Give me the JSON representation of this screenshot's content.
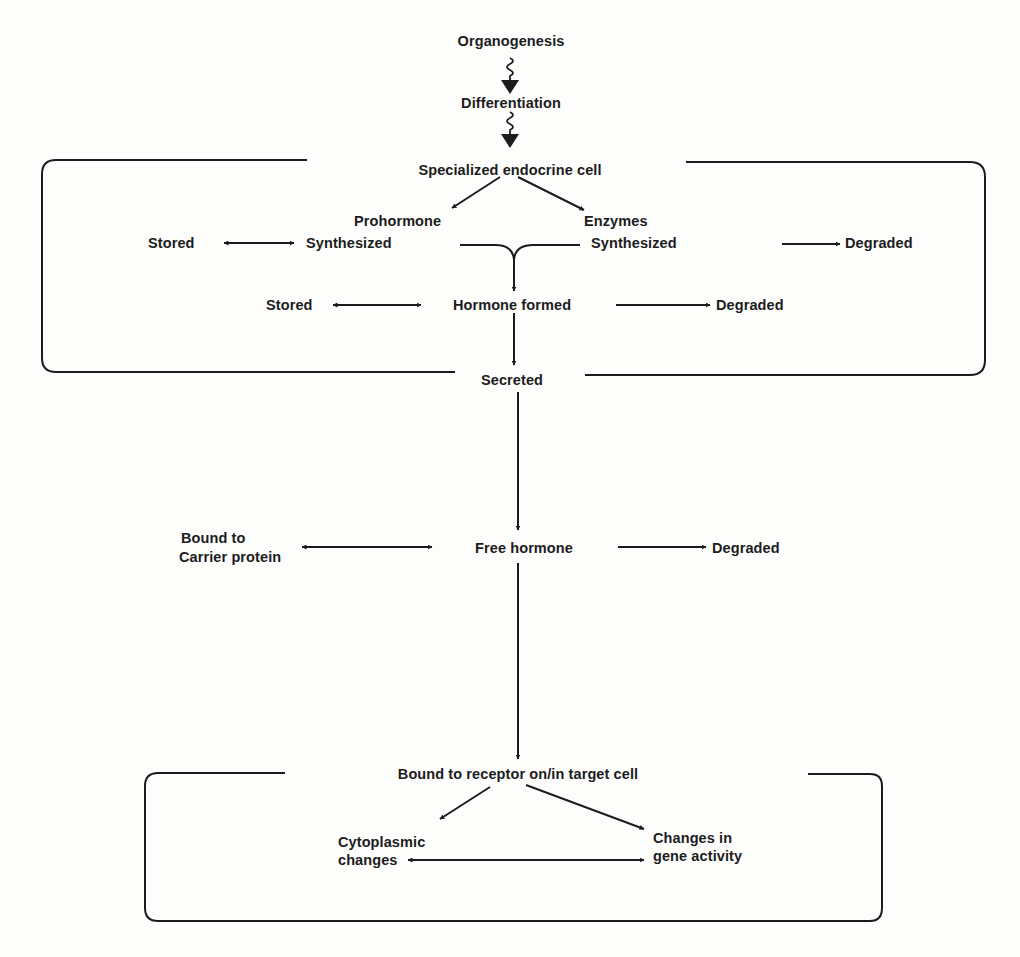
{
  "diagram": {
    "type": "flowchart",
    "nodes": {
      "organogenesis": "Organogenesis",
      "differentiation": "Differentiation",
      "specialized_cell": "Specialized endocrine cell",
      "prohormone": "Prohormone",
      "prohormone_synthesized": "Synthesized",
      "prohormone_stored": "Stored",
      "enzymes": "Enzymes",
      "enzymes_synthesized": "Synthesized",
      "enzymes_degraded": "Degraded",
      "hormone_formed": "Hormone formed",
      "hormone_stored": "Stored",
      "hormone_degraded": "Degraded",
      "secreted": "Secreted",
      "bound_carrier_line1": "Bound to",
      "bound_carrier_line2": "Carrier protein",
      "free_hormone": "Free hormone",
      "free_degraded": "Degraded",
      "bound_receptor": "Bound to receptor on/in target cell",
      "cytoplasmic_line1": "Cytoplasmic",
      "cytoplasmic_line2": "changes",
      "gene_line1": "Changes in",
      "gene_line2": "gene activity"
    },
    "edges": [
      {
        "from": "Organogenesis",
        "to": "Differentiation",
        "style": "wavy"
      },
      {
        "from": "Differentiation",
        "to": "Specialized endocrine cell",
        "style": "wavy"
      },
      {
        "from": "Specialized endocrine cell",
        "to": "Prohormone Synthesized",
        "style": "arrow"
      },
      {
        "from": "Specialized endocrine cell",
        "to": "Enzymes Synthesized",
        "style": "arrow"
      },
      {
        "from": "Prohormone Synthesized",
        "to": "Stored",
        "style": "bidirectional"
      },
      {
        "from": "Enzymes Synthesized",
        "to": "Degraded",
        "style": "arrow"
      },
      {
        "from": "Prohormone Synthesized + Enzymes Synthesized",
        "to": "Hormone formed",
        "style": "merge-arrow"
      },
      {
        "from": "Hormone formed",
        "to": "Stored",
        "style": "bidirectional"
      },
      {
        "from": "Hormone formed",
        "to": "Degraded",
        "style": "arrow"
      },
      {
        "from": "Hormone formed",
        "to": "Secreted",
        "style": "arrow"
      },
      {
        "from": "Secreted",
        "to": "Free hormone",
        "style": "arrow"
      },
      {
        "from": "Free hormone",
        "to": "Bound to Carrier protein",
        "style": "bidirectional"
      },
      {
        "from": "Free hormone",
        "to": "Degraded",
        "style": "arrow"
      },
      {
        "from": "Free hormone",
        "to": "Bound to receptor on/in target cell",
        "style": "arrow"
      },
      {
        "from": "Bound to receptor on/in target cell",
        "to": "Cytoplasmic changes",
        "style": "arrow"
      },
      {
        "from": "Bound to receptor on/in target cell",
        "to": "Changes in gene activity",
        "style": "arrow"
      },
      {
        "from": "Cytoplasmic changes",
        "to": "Changes in gene activity",
        "style": "bidirectional"
      }
    ],
    "groups": [
      {
        "name": "endocrine-cell-boundary",
        "contains": [
          "Specialized endocrine cell",
          "Prohormone",
          "Enzymes",
          "Hormone formed",
          "Stored",
          "Degraded"
        ]
      },
      {
        "name": "target-cell-boundary",
        "contains": [
          "Bound to receptor on/in target cell",
          "Cytoplasmic changes",
          "Changes in gene activity"
        ]
      }
    ],
    "colors": {
      "ink": "#1c1c1c",
      "paper": "#fdfdfc"
    }
  }
}
